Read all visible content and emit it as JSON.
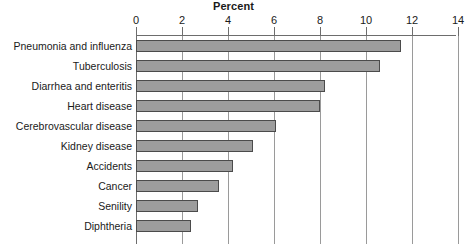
{
  "chart_data": {
    "type": "bar",
    "orientation": "horizontal",
    "title": "Percent",
    "xlabel": "",
    "ylabel": "",
    "xlim": [
      0,
      14
    ],
    "xticks": [
      0,
      2,
      4,
      6,
      8,
      10,
      12,
      14
    ],
    "xtick_labels": [
      "0",
      "2",
      "4",
      "6",
      "8",
      "10",
      "12",
      "14"
    ],
    "grid": true,
    "legend": null,
    "categories": [
      "Pneumonia and influenza",
      "Tuberculosis",
      "Diarrhea and enteritis",
      "Heart disease",
      "Cerebrovascular disease",
      "Kidney disease",
      "Accidents",
      "Cancer",
      "Senility",
      "Diphtheria"
    ],
    "values": [
      11.5,
      10.6,
      8.2,
      8.0,
      6.1,
      5.1,
      4.2,
      3.6,
      2.7,
      2.4
    ],
    "colors": {
      "bar_fill": "#9d9d9d",
      "bar_edge": "#4b4b4b",
      "gridline": "#9a9a9a",
      "axis": "#6d6d6d",
      "text": "#1a1a1a",
      "background": "#ffffff"
    }
  }
}
